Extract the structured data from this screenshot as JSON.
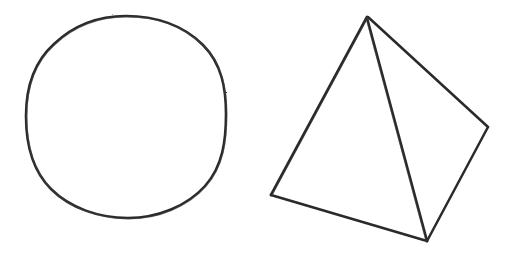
{
  "canvas": {
    "width": 513,
    "height": 261,
    "background_color": "#ffffff",
    "medium": "hand-drawn pencil/ink sketch"
  },
  "ink": {
    "stroke_color": "#2b2b2b",
    "stroke_color_light": "#4a4a4a",
    "stroke_width": 2.6
  },
  "shapes": [
    {
      "id": "circle",
      "name": "hand-drawn-circle",
      "kind": "circle",
      "center_x": 126,
      "center_y": 117,
      "radius_x": 100,
      "radius_y": 101,
      "bbox": {
        "left": 26,
        "top": 16,
        "right": 226,
        "bottom": 218
      },
      "path": "M 126 16 C 155 16 183 25 203 45 C 222 64 226 89 226 114 C 226 140 223 166 205 186 C 187 206 158 218 128 218 C 99 218 70 208 51 189 C 32 170 26 143 26 116 C 26 89 33 63 54 44 C 74 25 99 16 126 16 Z"
    },
    {
      "id": "tetrahedron",
      "name": "hand-drawn-tetrahedron",
      "kind": "wireframe-polyhedron",
      "bbox": {
        "left": 271,
        "top": 16,
        "right": 489,
        "bottom": 242
      },
      "vertices": [
        {
          "id": "apex",
          "label": "apex",
          "x": 367,
          "y": 17
        },
        {
          "id": "left",
          "label": "left-base",
          "x": 272,
          "y": 194
        },
        {
          "id": "front",
          "label": "front-base",
          "x": 427,
          "y": 240
        },
        {
          "id": "right",
          "label": "right-base",
          "x": 487,
          "y": 127
        }
      ],
      "edges": [
        {
          "id": "apex-left",
          "from": "apex",
          "to": "left",
          "path": "M 367 17 L 271 195"
        },
        {
          "id": "apex-front",
          "from": "apex",
          "to": "front",
          "path": "M 367 18 L 427 241"
        },
        {
          "id": "apex-right",
          "from": "apex",
          "to": "right",
          "path": "M 368 17 L 488 127"
        },
        {
          "id": "left-front",
          "from": "left",
          "to": "front",
          "path": "M 271 195 L 427 241"
        },
        {
          "id": "front-right",
          "from": "front",
          "to": "right",
          "path": "M 427 241 L 488 127"
        }
      ]
    }
  ]
}
